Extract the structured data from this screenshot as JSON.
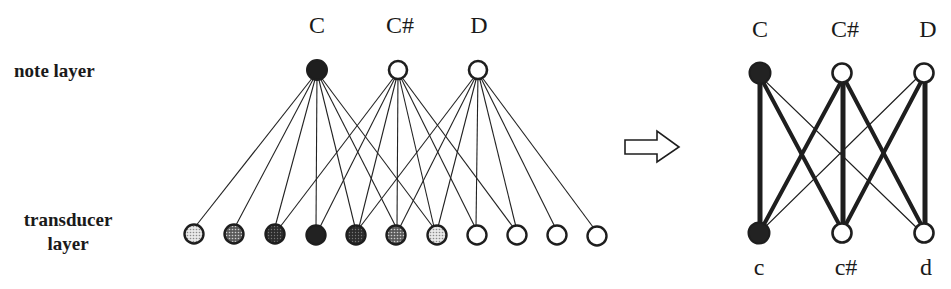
{
  "left_diagram": {
    "labels": {
      "note_layer": "note layer",
      "transducer_layer_line1": "transducer",
      "transducer_layer_line2": "layer"
    },
    "note_nodes": [
      {
        "label": "C",
        "state": "active"
      },
      {
        "label": "C#",
        "state": "inactive"
      },
      {
        "label": "D",
        "state": "inactive"
      }
    ],
    "transducer_nodes": [
      {
        "index": 0,
        "fill": "light-dotted"
      },
      {
        "index": 1,
        "fill": "medium-dotted"
      },
      {
        "index": 2,
        "fill": "dark-dotted"
      },
      {
        "index": 3,
        "fill": "solid"
      },
      {
        "index": 4,
        "fill": "dark-dotted"
      },
      {
        "index": 5,
        "fill": "medium-dotted"
      },
      {
        "index": 6,
        "fill": "light-dotted"
      },
      {
        "index": 7,
        "fill": "empty"
      },
      {
        "index": 8,
        "fill": "empty"
      },
      {
        "index": 9,
        "fill": "empty"
      },
      {
        "index": 10,
        "fill": "empty"
      }
    ],
    "connections": {
      "C": [
        0,
        1,
        2,
        3,
        4,
        5,
        6
      ],
      "C#": [
        2,
        3,
        4,
        5,
        6,
        7,
        8
      ],
      "D": [
        4,
        5,
        6,
        7,
        8,
        9,
        10
      ]
    }
  },
  "arrow": {
    "direction": "right",
    "style": "outline"
  },
  "right_diagram": {
    "top_nodes": [
      {
        "label": "C",
        "state": "active"
      },
      {
        "label": "C#",
        "state": "inactive"
      },
      {
        "label": "D",
        "state": "inactive"
      }
    ],
    "bottom_nodes": [
      {
        "label": "c",
        "state": "active"
      },
      {
        "label": "c#",
        "state": "inactive"
      },
      {
        "label": "d",
        "state": "inactive"
      }
    ],
    "edges": [
      {
        "from": "C",
        "to": "c",
        "weight": "thick"
      },
      {
        "from": "C",
        "to": "c#",
        "weight": "thick"
      },
      {
        "from": "C",
        "to": "d",
        "weight": "thin"
      },
      {
        "from": "C#",
        "to": "c",
        "weight": "thick"
      },
      {
        "from": "C#",
        "to": "c#",
        "weight": "thick"
      },
      {
        "from": "C#",
        "to": "d",
        "weight": "thick"
      },
      {
        "from": "D",
        "to": "c",
        "weight": "thin"
      },
      {
        "from": "D",
        "to": "c#",
        "weight": "thick"
      },
      {
        "from": "D",
        "to": "d",
        "weight": "thick"
      }
    ]
  },
  "colors": {
    "ink": "#1a1a1a",
    "background": "#ffffff",
    "light_dot": "#bdbdbd",
    "medium_dot": "#7a7a7a",
    "dark_dot": "#3c3c3c"
  }
}
